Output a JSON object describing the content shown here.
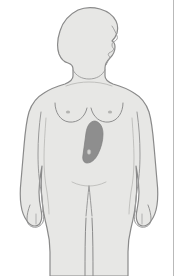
{
  "diagram": {
    "title": "Female body anterior silhouette with highlighted abdominal organ region",
    "view": "anterior body, head shown in right-facing profile",
    "subject": "female",
    "caption": "",
    "canvas": {
      "width": 178,
      "height": 276
    }
  },
  "colors": {
    "background": "#ffffff",
    "body_fill": "#e7e7e5",
    "body_outline": "#8a8a8a",
    "detail_line": "#9a9a9a",
    "highlight_fill": "#8e8e8e",
    "highlight_outline": "#7c7c7c",
    "rule_line": "#b9b9b9"
  },
  "regions": [
    {
      "id": "head",
      "label": "Head (right profile)",
      "interactable": false
    },
    {
      "id": "neck",
      "label": "Neck",
      "interactable": false
    },
    {
      "id": "torso",
      "label": "Torso",
      "interactable": false
    },
    {
      "id": "left-arm",
      "label": "Left arm",
      "interactable": false
    },
    {
      "id": "right-arm",
      "label": "Right arm",
      "interactable": false
    },
    {
      "id": "left-leg",
      "label": "Left leg",
      "interactable": false
    },
    {
      "id": "right-leg",
      "label": "Right leg",
      "interactable": false
    },
    {
      "id": "breast-left",
      "label": "Left breast contour",
      "interactable": false
    },
    {
      "id": "breast-right",
      "label": "Right breast contour",
      "interactable": false
    },
    {
      "id": "navel",
      "label": "Navel",
      "interactable": false
    }
  ],
  "highlight": {
    "id": "organ-highlight",
    "label": "Highlighted organ region, upper left abdomen",
    "location": "upper abdomen, left of midline (viewer right of center)",
    "shape": "rounded elongated oval, tapering downward",
    "fill": "#8e8e8e",
    "bbox": {
      "x": 83,
      "y": 121,
      "width": 20,
      "height": 42
    }
  },
  "annotations": {
    "markers": [],
    "legend": []
  }
}
